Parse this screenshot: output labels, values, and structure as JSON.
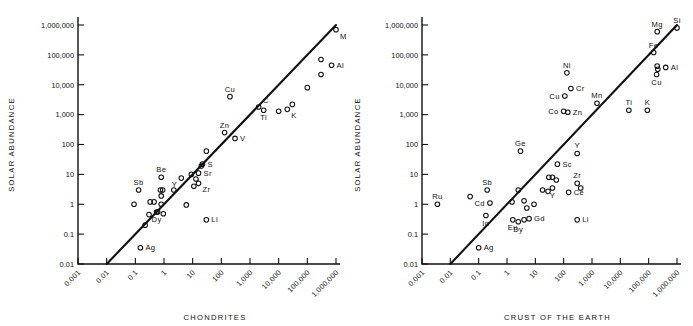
{
  "figure": {
    "panels": [
      "left",
      "right"
    ],
    "marker_shape": "open-circle",
    "background": "#ffffff",
    "ink_color": "#111111"
  },
  "chart_data": [
    {
      "type": "scatter",
      "panel": "left",
      "title": "",
      "xlabel": "CHONDRITES",
      "ylabel": "SOLAR ABUNDANCE",
      "xscale": "log",
      "yscale": "log",
      "xlim": [
        0.001,
        1000000
      ],
      "ylim": [
        0.01,
        1000000
      ],
      "xticks": [
        0.001,
        0.01,
        0.1,
        1,
        10,
        100,
        1000,
        10000,
        100000,
        1000000
      ],
      "xtick_labels": [
        "0.001",
        "0.01",
        "0.1",
        "1",
        "10",
        "100",
        "1,000",
        "10,000",
        "100,000",
        "1,000,000"
      ],
      "yticks": [
        0.01,
        0.1,
        1,
        10,
        100,
        1000,
        10000,
        100000,
        1000000
      ],
      "ytick_labels": [
        "0.01",
        "0.1",
        "1",
        "10",
        "100",
        "1,000",
        "10,000",
        "100,000",
        "1,000,000"
      ],
      "grid": false,
      "legend": "none",
      "fit_line": {
        "x0": 0.01,
        "y0": 0.01,
        "x1": 1000000,
        "y1": 1000000,
        "note": "1:1 reference line"
      },
      "points": [
        {
          "x": 1000000,
          "y": 700000,
          "label": "Mg",
          "label_pos": "below-right"
        },
        {
          "x": 300000,
          "y": 70000,
          "label": "",
          "label_pos": ""
        },
        {
          "x": 700000,
          "y": 45000,
          "label": "Al",
          "label_pos": "right"
        },
        {
          "x": 300000,
          "y": 22000,
          "label": "",
          "label_pos": ""
        },
        {
          "x": 100000,
          "y": 8000,
          "label": "",
          "label_pos": ""
        },
        {
          "x": 30000,
          "y": 2200,
          "label": "",
          "label_pos": ""
        },
        {
          "x": 20000,
          "y": 1500,
          "label": "K",
          "label_pos": "below-right"
        },
        {
          "x": 10000,
          "y": 1300,
          "label": "",
          "label_pos": ""
        },
        {
          "x": 3000,
          "y": 1400,
          "label": "Ti",
          "label_pos": "below"
        },
        {
          "x": 2000,
          "y": 1800,
          "label": "C",
          "label_pos": "above-right"
        },
        {
          "x": 200,
          "y": 4000,
          "label": "Cu",
          "label_pos": "above"
        },
        {
          "x": 130,
          "y": 250,
          "label": "Zn",
          "label_pos": "above"
        },
        {
          "x": 300,
          "y": 160,
          "label": "V",
          "label_pos": "right"
        },
        {
          "x": 30,
          "y": 60,
          "label": "",
          "label_pos": ""
        },
        {
          "x": 22,
          "y": 22,
          "label": "S",
          "label_pos": "right"
        },
        {
          "x": 20,
          "y": 19,
          "label": "",
          "label_pos": ""
        },
        {
          "x": 16,
          "y": 11,
          "label": "Sr",
          "label_pos": "right"
        },
        {
          "x": 9,
          "y": 10,
          "label": "",
          "label_pos": ""
        },
        {
          "x": 13,
          "y": 7,
          "label": "",
          "label_pos": ""
        },
        {
          "x": 4,
          "y": 7.5,
          "label": "Y",
          "label_pos": "below-left"
        },
        {
          "x": 16,
          "y": 5,
          "label": "Zr",
          "label_pos": "below-right"
        },
        {
          "x": 11,
          "y": 4,
          "label": "",
          "label_pos": ""
        },
        {
          "x": 0.8,
          "y": 8,
          "label": "Be",
          "label_pos": "above"
        },
        {
          "x": 2.2,
          "y": 3,
          "label": "",
          "label_pos": ""
        },
        {
          "x": 0.75,
          "y": 3,
          "label": "",
          "label_pos": ""
        },
        {
          "x": 0.9,
          "y": 3,
          "label": "",
          "label_pos": ""
        },
        {
          "x": 0.13,
          "y": 3,
          "label": "Sb",
          "label_pos": "above"
        },
        {
          "x": 0.8,
          "y": 1.9,
          "label": "",
          "label_pos": ""
        },
        {
          "x": 0.33,
          "y": 1.2,
          "label": "",
          "label_pos": ""
        },
        {
          "x": 0.45,
          "y": 1.2,
          "label": "",
          "label_pos": ""
        },
        {
          "x": 0.8,
          "y": 1.0,
          "label": "",
          "label_pos": ""
        },
        {
          "x": 0.09,
          "y": 1.0,
          "label": "",
          "label_pos": ""
        },
        {
          "x": 6,
          "y": 0.95,
          "label": "",
          "label_pos": ""
        },
        {
          "x": 0.55,
          "y": 0.55,
          "label": "Dy",
          "label_pos": "below"
        },
        {
          "x": 0.6,
          "y": 0.55,
          "label": "",
          "label_pos": ""
        },
        {
          "x": 0.95,
          "y": 0.48,
          "label": "",
          "label_pos": ""
        },
        {
          "x": 0.3,
          "y": 0.45,
          "label": "",
          "label_pos": ""
        },
        {
          "x": 0.22,
          "y": 0.2,
          "label": "",
          "label_pos": ""
        },
        {
          "x": 30,
          "y": 0.3,
          "label": "Li",
          "label_pos": "right"
        },
        {
          "x": 0.15,
          "y": 0.035,
          "label": "Ag",
          "label_pos": "right"
        }
      ]
    },
    {
      "type": "scatter",
      "panel": "right",
      "title": "",
      "xlabel": "CRUST OF THE EARTH",
      "ylabel": "SOLAR ABUNDANCE",
      "xscale": "log",
      "yscale": "log",
      "xlim": [
        0.001,
        1000000
      ],
      "ylim": [
        0.01,
        1000000
      ],
      "xticks": [
        0.001,
        0.01,
        0.1,
        1,
        10,
        100,
        1000,
        10000,
        100000,
        1000000
      ],
      "xtick_labels": [
        "0.001",
        "0.01",
        "0.1",
        "1",
        "10",
        "100",
        "1,000",
        "10,000",
        "100,000",
        "1,000,000"
      ],
      "yticks": [
        0.01,
        0.1,
        1,
        10,
        100,
        1000,
        10000,
        100000,
        1000000
      ],
      "ytick_labels": [
        "0.01",
        "0.1",
        "1",
        "10",
        "100",
        "1,000",
        "10,000",
        "100,000",
        "1,000,000"
      ],
      "grid": false,
      "legend": "none",
      "fit_line": {
        "x0": 0.01,
        "y0": 0.01,
        "x1": 1000000,
        "y1": 1000000,
        "note": "1:1 reference line"
      },
      "points": [
        {
          "x": 1000000,
          "y": 800000,
          "label": "Si",
          "label_pos": "above"
        },
        {
          "x": 200000,
          "y": 600000,
          "label": "Mg",
          "label_pos": "above"
        },
        {
          "x": 150000,
          "y": 120000,
          "label": "Fe",
          "label_pos": "above"
        },
        {
          "x": 200000,
          "y": 42000,
          "label": "",
          "label_pos": ""
        },
        {
          "x": 210000,
          "y": 33000,
          "label": "",
          "label_pos": ""
        },
        {
          "x": 400000,
          "y": 38000,
          "label": "Al",
          "label_pos": "right"
        },
        {
          "x": 190000,
          "y": 22000,
          "label": "Cu",
          "label_pos": "below"
        },
        {
          "x": 130,
          "y": 25000,
          "label": "Ni",
          "label_pos": "above"
        },
        {
          "x": 180,
          "y": 7500,
          "label": "Cr",
          "label_pos": "right"
        },
        {
          "x": 110,
          "y": 4200,
          "label": "Cu",
          "label_pos": "left"
        },
        {
          "x": 1500,
          "y": 2400,
          "label": "Mn",
          "label_pos": "above"
        },
        {
          "x": 100,
          "y": 1300,
          "label": "Co",
          "label_pos": "left"
        },
        {
          "x": 140,
          "y": 1200,
          "label": "Zn",
          "label_pos": "right"
        },
        {
          "x": 20000,
          "y": 1400,
          "label": "Ti",
          "label_pos": "above"
        },
        {
          "x": 90000,
          "y": 1400,
          "label": "K",
          "label_pos": "above"
        },
        {
          "x": 3,
          "y": 60,
          "label": "Ge",
          "label_pos": "above"
        },
        {
          "x": 300,
          "y": 50,
          "label": "Y",
          "label_pos": "above"
        },
        {
          "x": 60,
          "y": 22,
          "label": "Sc",
          "label_pos": "right"
        },
        {
          "x": 30,
          "y": 8,
          "label": "",
          "label_pos": ""
        },
        {
          "x": 40,
          "y": 8,
          "label": "",
          "label_pos": ""
        },
        {
          "x": 55,
          "y": 6.5,
          "label": "",
          "label_pos": ""
        },
        {
          "x": 300,
          "y": 5,
          "label": "Zr",
          "label_pos": "above"
        },
        {
          "x": 400,
          "y": 3.5,
          "label": "",
          "label_pos": ""
        },
        {
          "x": 40,
          "y": 3.5,
          "label": "Y",
          "label_pos": "below"
        },
        {
          "x": 28,
          "y": 2.7,
          "label": "",
          "label_pos": ""
        },
        {
          "x": 150,
          "y": 2.5,
          "label": "Ce",
          "label_pos": "right"
        },
        {
          "x": 18,
          "y": 3,
          "label": "",
          "label_pos": ""
        },
        {
          "x": 2.5,
          "y": 3,
          "label": "",
          "label_pos": ""
        },
        {
          "x": 0.2,
          "y": 3,
          "label": "Sb",
          "label_pos": "above"
        },
        {
          "x": 0.05,
          "y": 1.8,
          "label": "",
          "label_pos": ""
        },
        {
          "x": 0.25,
          "y": 1.1,
          "label": "Cd",
          "label_pos": "left"
        },
        {
          "x": 0.0035,
          "y": 1.0,
          "label": "Ru",
          "label_pos": "above"
        },
        {
          "x": 1.5,
          "y": 1.2,
          "label": "",
          "label_pos": ""
        },
        {
          "x": 4,
          "y": 1.3,
          "label": "",
          "label_pos": ""
        },
        {
          "x": 9,
          "y": 1.0,
          "label": "",
          "label_pos": ""
        },
        {
          "x": 5,
          "y": 0.75,
          "label": "",
          "label_pos": ""
        },
        {
          "x": 0.18,
          "y": 0.42,
          "label": "In",
          "label_pos": "below"
        },
        {
          "x": 1.6,
          "y": 0.3,
          "label": "Eu",
          "label_pos": "below"
        },
        {
          "x": 2.5,
          "y": 0.26,
          "label": "Dy",
          "label_pos": "below"
        },
        {
          "x": 4,
          "y": 0.3,
          "label": "",
          "label_pos": ""
        },
        {
          "x": 6,
          "y": 0.33,
          "label": "Gd",
          "label_pos": "right"
        },
        {
          "x": 300,
          "y": 0.3,
          "label": "Li",
          "label_pos": "right"
        },
        {
          "x": 0.1,
          "y": 0.035,
          "label": "Ag",
          "label_pos": "right"
        }
      ]
    }
  ]
}
